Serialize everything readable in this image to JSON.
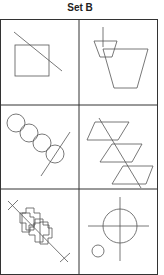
{
  "title": "Set B",
  "colors": {
    "stroke": "#555555",
    "border": "#333333",
    "background": "#ffffff"
  },
  "grid": {
    "rows": 3,
    "cols": 2
  },
  "cells": [
    {
      "id": 1,
      "description": "Square crossed by a diagonal line"
    },
    {
      "id": 2,
      "description": "Small trapezoid with vertical line overlapping a large trapezoid"
    },
    {
      "id": 3,
      "description": "Four overlapping circles in a diagonal chain crossed by a line"
    },
    {
      "id": 4,
      "description": "Three parallelograms stacked diagonally crossed by a line"
    },
    {
      "id": 5,
      "description": "Two overlapping cross shapes on a diagonal line with X marks at both ends"
    },
    {
      "id": 6,
      "description": "Large circle with crosshair lines and a small circle at lower left"
    }
  ]
}
